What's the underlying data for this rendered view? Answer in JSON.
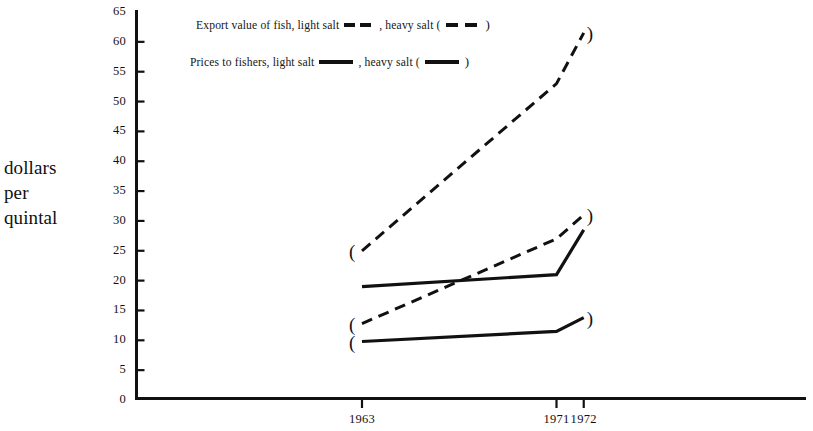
{
  "axis_title": {
    "line1": "dollars",
    "line2": "per",
    "line3": "quintal"
  },
  "legend": {
    "export": {
      "prefix": "Export value of fish, light salt",
      "middle": ", heavy salt (",
      "suffix": ")"
    },
    "prices": {
      "prefix": "Prices to fishers, light salt",
      "middle": ", heavy salt (",
      "suffix": ")"
    }
  },
  "marker_open": "(",
  "marker_close": ")",
  "chart_data": {
    "type": "line",
    "title": "",
    "xlabel": "",
    "ylabel": "dollars per quintal",
    "x": [
      "1963",
      "1971",
      "1972"
    ],
    "x_positions": [
      0,
      1,
      1.14
    ],
    "xtick_labels": [
      "1963",
      "1971",
      "1972"
    ],
    "ytick_labels": [
      "0",
      "5",
      "10",
      "15",
      "20",
      "25",
      "30",
      "35",
      "40",
      "45",
      "50",
      "55",
      "60",
      "65"
    ],
    "ylim": [
      0,
      65
    ],
    "ytick_step": 5,
    "grid": false,
    "legend_position": "top-inside",
    "line_color": "#111111",
    "series": [
      {
        "name": "Export value of fish, heavy salt",
        "style": "dashed",
        "bracketed": true,
        "values": [
          25,
          53,
          61.5
        ]
      },
      {
        "name": "Prices to fishers, light salt",
        "style": "solid",
        "bracketed": false,
        "values": [
          19,
          21,
          28.5
        ]
      },
      {
        "name": "Export value of fish, light salt",
        "style": "dashed",
        "bracketed": true,
        "values": [
          12.8,
          27,
          31
        ]
      },
      {
        "name": "Prices to fishers, heavy salt",
        "style": "solid",
        "bracketed": true,
        "values": [
          9.8,
          11.5,
          13.8
        ]
      }
    ]
  }
}
